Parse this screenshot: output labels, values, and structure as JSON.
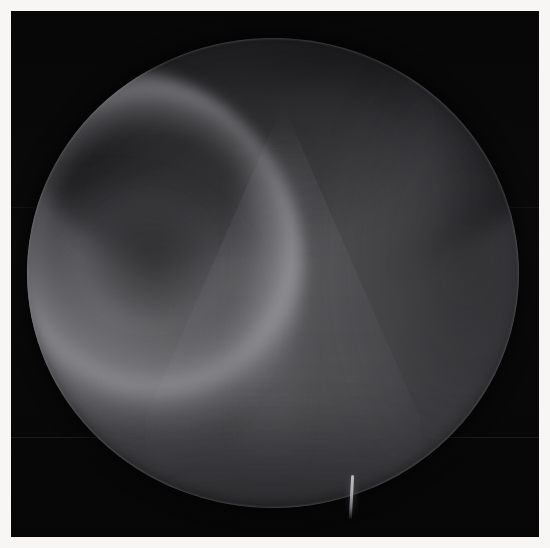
{
  "image": {
    "modality": "fluoroscopy",
    "kind": "grayscale-radiograph",
    "field_of_view_shape": "circular",
    "title": "",
    "caption": "",
    "overlay_text": "",
    "annotations": []
  },
  "colors": {
    "page_background": "#ffffff",
    "frame_border": "#f7f6f4",
    "plate_background": "#060607",
    "fov_center_gray": "#4e4e50",
    "fov_edge_gray": "#1b1b1e",
    "bright_structure": "#cdcdd2",
    "dark_structure": "#101012",
    "probe_highlight": "#d2d2d6"
  },
  "geometry": {
    "canvas_width": 550,
    "canvas_height": 548,
    "border_thickness": 11,
    "fov_center_x": 272,
    "fov_center_y": 273,
    "fov_radius_x": 246,
    "fov_radius_y": 235
  },
  "features": [
    {
      "name": "superior-dark-crescent",
      "region": "top",
      "tone": "dark"
    },
    {
      "name": "bone-ridge-curve",
      "region": "upper-left",
      "tone": "bright"
    },
    {
      "name": "soft-tissue-lobe",
      "region": "left",
      "tone": "bright"
    },
    {
      "name": "dark-recess-pocket",
      "region": "left-of-center",
      "tone": "dark"
    },
    {
      "name": "oblique-dark-band",
      "region": "upper-center",
      "tone": "dark"
    },
    {
      "name": "central-tent-density",
      "region": "center",
      "tone": "bright"
    },
    {
      "name": "midline-stripe",
      "region": "center",
      "tone": "bright"
    },
    {
      "name": "right-lateral-shadow",
      "region": "right",
      "tone": "dark"
    },
    {
      "name": "inferior-shadow",
      "region": "bottom",
      "tone": "dark"
    },
    {
      "name": "instrument-probe-tip",
      "region": "inferior-border",
      "tone": "bright"
    },
    {
      "name": "horizontal-scanline-artifact",
      "region": "lower-left",
      "tone": "faint"
    }
  ]
}
